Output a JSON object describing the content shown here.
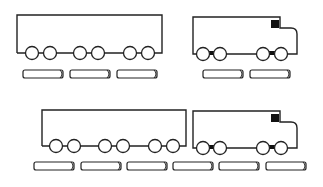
{
  "figure": {
    "stroke_color": "#222222",
    "fill_color": "#ffffff",
    "window_color": "#111111"
  },
  "rows": [
    {
      "trailer": {
        "x": 17,
        "y": 15,
        "w": 145,
        "h": 38,
        "wheels": [
          32,
          50,
          80,
          98,
          130,
          148
        ]
      },
      "truck": {
        "x": 193,
        "y": 17,
        "wheels": [
          203,
          220,
          263,
          281
        ]
      },
      "bars": [
        [
          23,
          63
        ],
        [
          70,
          110
        ],
        [
          117,
          157
        ],
        [
          203,
          243
        ],
        [
          250,
          290
        ]
      ],
      "bar_y": 70
    },
    {
      "trailer": {
        "x": 42,
        "y": 110,
        "w": 144,
        "h": 36,
        "wheels": [
          56,
          74,
          105,
          123,
          155,
          173
        ]
      },
      "truck": {
        "x": 193,
        "y": 111,
        "wheels": [
          203,
          220,
          263,
          281
        ]
      },
      "bars": [
        [
          34,
          74
        ],
        [
          81,
          121
        ],
        [
          127,
          167
        ],
        [
          173,
          213
        ],
        [
          219,
          259
        ],
        [
          266,
          306
        ]
      ],
      "bar_y": 162
    }
  ]
}
